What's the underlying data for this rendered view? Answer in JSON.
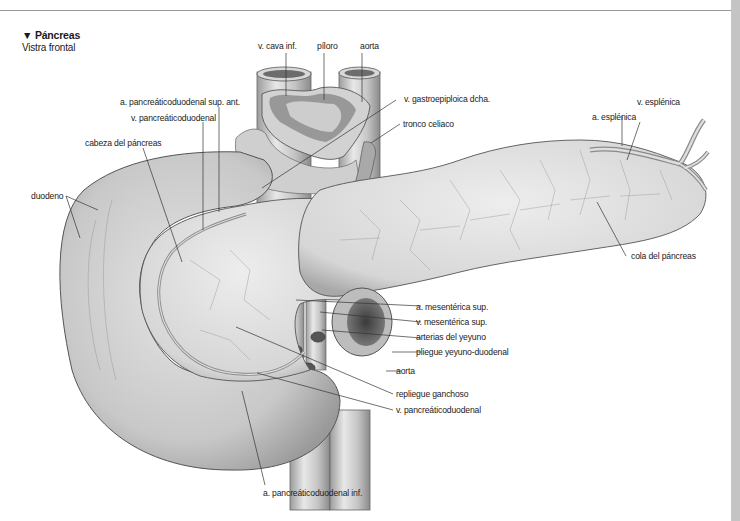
{
  "header": {
    "title_marker": "▼",
    "title": "Páncreas",
    "subtitle": "Vistra frontal"
  },
  "labels": {
    "v_cava_inf": "v. cava inf.",
    "piloro": "píloro",
    "aorta_top": "aorta",
    "a_pancreaticoduodenal_sup_ant": "a. pancreáticoduodenal sup. ant.",
    "v_gastroepiploica_dcha": "v. gastroepiploica dcha.",
    "v_pancreaticoduodenal_top": "v. pancreáticoduodenal",
    "tronco_celiaco": "tronco celiaco",
    "cabeza_del_pancreas": "cabeza del páncreas",
    "v_esplenica": "v. esplénica",
    "a_esplenica": "a. esplénica",
    "duodeno": "duodeno",
    "cola_del_pancreas": "cola del páncreas",
    "a_mesenterica_sup": "a. mesentérica sup.",
    "v_mesenterica_sup": "v. mesentérica sup.",
    "arterias_del_yeyuno": "arterias del yeyuno",
    "pliegue_yeyuno_duodenal": "pliegue yeyuno-duodenal",
    "aorta_bottom": "aorta",
    "repliegue_ganchoso": "repliegue ganchoso",
    "v_pancreaticoduodenal_bottom": "v. pancreáticoduodenal",
    "a_pancreaticoduodenal_inf": "a. pancreáticoduodenal inf."
  },
  "colors": {
    "rule": "#9a9a9a",
    "side_bar": "#c4c4c4",
    "tissue_light": "#e6e6e6",
    "tissue_mid": "#c9c9c9",
    "tissue_dark": "#8e8e8e",
    "vessel": "#a8a8a8",
    "leader": "#333333"
  }
}
